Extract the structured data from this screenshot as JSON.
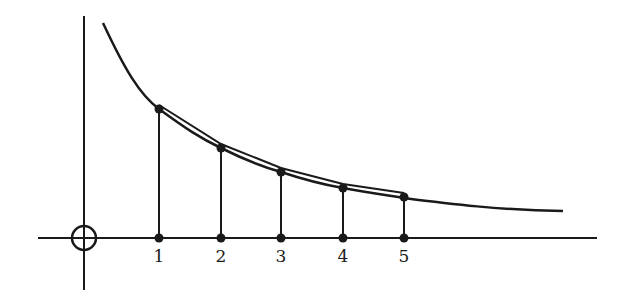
{
  "diagram": {
    "colors": {
      "stroke": "#1a1a1a",
      "background": "#ffffff"
    },
    "origin_marker": "circle-with-cross",
    "x_labels": [
      "1",
      "2",
      "3",
      "4",
      "5"
    ],
    "points": [
      {
        "label": "1",
        "x_px": 159,
        "y_px": 109
      },
      {
        "label": "2",
        "x_px": 221,
        "y_px": 148
      },
      {
        "label": "3",
        "x_px": 281,
        "y_px": 172
      },
      {
        "label": "4",
        "x_px": 343,
        "y_px": 188
      },
      {
        "label": "5",
        "x_px": 404,
        "y_px": 197
      }
    ]
  }
}
